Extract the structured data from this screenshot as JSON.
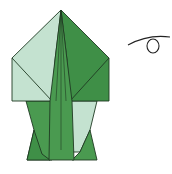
{
  "diagram": {
    "type": "origami-step",
    "colors": {
      "dark_green": "#3f8f47",
      "mid_green": "#4a9a50",
      "light_green": "#c4e2d0",
      "outline": "#1f3a22"
    },
    "symbols": [
      "turn-over-symbol"
    ]
  }
}
